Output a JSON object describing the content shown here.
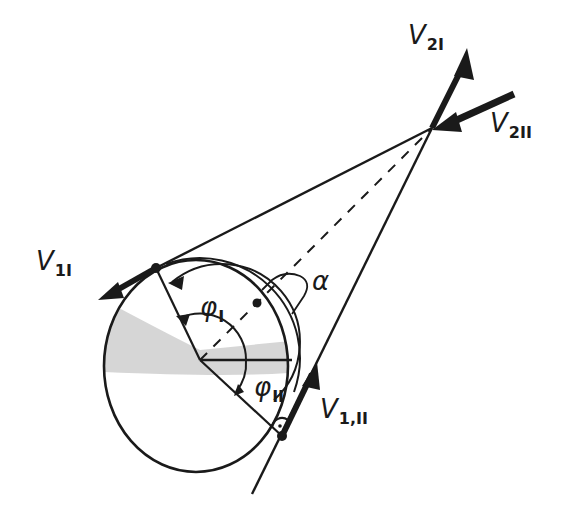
{
  "diagram": {
    "type": "hand-drawn geometric sketch",
    "colors": {
      "ink": "#1a1a1a",
      "shading": "#c8c8c8",
      "background": "#ffffff"
    }
  },
  "labels": {
    "v2_1": {
      "main": "V",
      "sub": "2I"
    },
    "v2_2": {
      "main": "V",
      "sub": "2II"
    },
    "v1_1": {
      "main": "V",
      "sub": "1I"
    },
    "v1_2": {
      "main": "V",
      "sub": "1,II"
    },
    "phi_1": {
      "main": "φ",
      "sub": "I"
    },
    "phi_2": {
      "main": "φ",
      "sub": "II"
    },
    "alpha": {
      "main": "α"
    }
  }
}
